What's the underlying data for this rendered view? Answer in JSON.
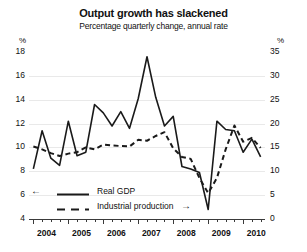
{
  "chart_data": {
    "type": "line",
    "title": "Output growth has slackened",
    "subtitle": "Percentage quarterly change, annual rate",
    "xlabel": "",
    "ylabel_left": "%",
    "ylabel_right": "%",
    "ylim_left": [
      4,
      18
    ],
    "ylim_right": [
      0,
      35
    ],
    "yticks_left": [
      4,
      6,
      8,
      10,
      12,
      14,
      16,
      18
    ],
    "yticks_right": [
      0,
      5,
      10,
      15,
      20,
      25,
      30,
      35
    ],
    "xticks": [
      "2004",
      "2005",
      "2006",
      "2007",
      "2008",
      "2009",
      "2010"
    ],
    "x_minor_interval": "quarterly",
    "grid": true,
    "legend_position": "lower-left",
    "x": [
      "2004Q1",
      "2004Q2",
      "2004Q3",
      "2004Q4",
      "2005Q1",
      "2005Q2",
      "2005Q3",
      "2005Q4",
      "2006Q1",
      "2006Q2",
      "2006Q3",
      "2006Q4",
      "2007Q1",
      "2007Q2",
      "2007Q3",
      "2007Q4",
      "2008Q1",
      "2008Q2",
      "2008Q3",
      "2008Q4",
      "2009Q1",
      "2009Q2",
      "2009Q3",
      "2009Q4",
      "2010Q1",
      "2010Q2",
      "2010Q3"
    ],
    "series": [
      {
        "name": "Real GDP",
        "axis": "left",
        "style": "solid",
        "color": "#1a1a1a",
        "values": [
          8.2,
          11.4,
          9.1,
          8.5,
          12.2,
          9.3,
          9.6,
          13.6,
          12.9,
          11.8,
          13.0,
          11.6,
          14.1,
          17.6,
          14.2,
          11.8,
          12.6,
          8.4,
          8.2,
          7.9,
          4.8,
          12.2,
          11.5,
          11.4,
          9.6,
          10.7,
          9.2
        ]
      },
      {
        "name": "Industrial production",
        "axis": "right",
        "style": "dashed",
        "color": "#1a1a1a",
        "values": [
          15.2,
          14.6,
          13.8,
          13.2,
          13.7,
          14.0,
          15.0,
          14.6,
          15.6,
          15.4,
          15.3,
          15.2,
          16.6,
          16.4,
          17.4,
          18.2,
          14.8,
          13.0,
          12.6,
          8.6,
          5.4,
          8.6,
          14.6,
          19.6,
          16.2,
          17.0,
          14.9
        ]
      }
    ],
    "legend": [
      {
        "label": "Real GDP",
        "style": "solid",
        "arrow": "left",
        "arrow_glyph": "←",
        "axis_note": "left scale"
      },
      {
        "label": "Industrial production",
        "style": "dashed",
        "arrow": "right",
        "arrow_glyph": "→",
        "axis_note": "right scale"
      }
    ]
  }
}
